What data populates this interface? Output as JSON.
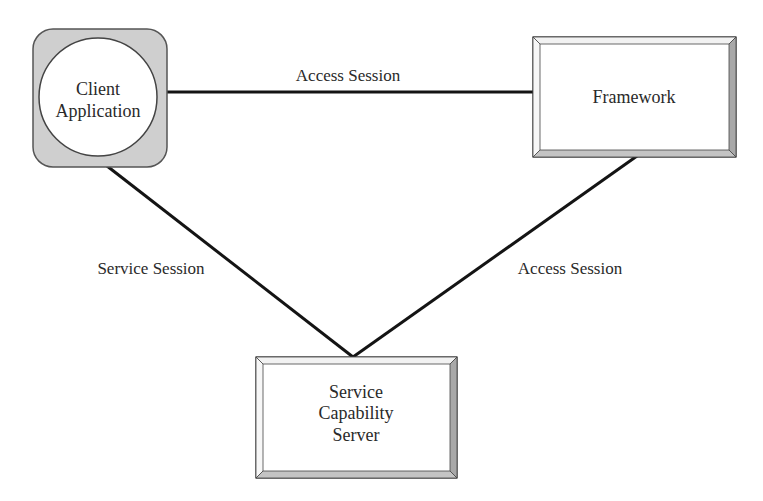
{
  "diagram": {
    "nodes": {
      "client": {
        "lines": [
          "Client",
          "Application"
        ]
      },
      "framework": {
        "lines": [
          "Framework"
        ]
      },
      "server": {
        "lines": [
          "Service",
          "Capability",
          "Server"
        ]
      }
    },
    "edges": {
      "client_framework": {
        "label": "Access Session"
      },
      "client_server": {
        "label": "Service Session"
      },
      "framework_server": {
        "label": "Access Session"
      }
    },
    "colors": {
      "line": "#141414",
      "client_bg": "#cfcfcf",
      "bevel_light": "#f2f2f2",
      "bevel_dark": "#a8a8a8",
      "box_fill": "#ffffff"
    }
  }
}
